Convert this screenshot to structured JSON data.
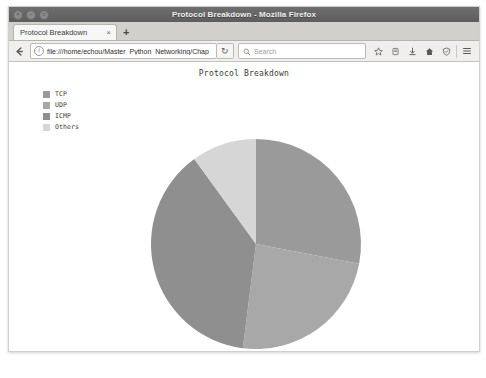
{
  "window": {
    "title": "Protocol Breakdown - Mozilla Firefox",
    "controls": [
      {
        "name": "close",
        "glyph": "×"
      },
      {
        "name": "minimize",
        "glyph": "−"
      },
      {
        "name": "maximize",
        "glyph": "□"
      }
    ]
  },
  "tabs": {
    "items": [
      {
        "label": "Protocol Breakdown",
        "close_glyph": "×"
      }
    ],
    "new_tab_glyph": "+"
  },
  "navbar": {
    "back_icon": "back-arrow-icon",
    "url_value": "file:///home/echou/Master_Python_Networking/Chap",
    "url_placeholder": "Search or enter address",
    "identity_glyph": "i",
    "reload_glyph": "↻",
    "search_placeholder": "Search",
    "tool_icons": [
      {
        "name": "bookmark-star-icon"
      },
      {
        "name": "reader-pocket-icon"
      },
      {
        "name": "downloads-icon"
      },
      {
        "name": "home-icon"
      },
      {
        "name": "shield-icon"
      },
      {
        "name": "menu-hamburger-icon"
      }
    ]
  },
  "colors": {
    "tcp": "#9a9a9a",
    "udp": "#a8a8a8",
    "icmp": "#8f8f8f",
    "others": "#d6d6d6",
    "page_bg": "#ffffff",
    "text": "#3a3a3a"
  },
  "chart_data": {
    "type": "pie",
    "title": "Protocol Breakdown",
    "xlabel": "",
    "ylabel": "",
    "legend_position": "upper-left",
    "grid": false,
    "start_angle": 90,
    "direction": "clockwise",
    "categories": [
      "TCP",
      "UDP",
      "ICMP",
      "Others"
    ],
    "values": [
      28,
      24,
      38,
      10
    ],
    "colors": [
      "#9a9a9a",
      "#a8a8a8",
      "#8f8f8f",
      "#d6d6d6"
    ],
    "slices": [
      {
        "label": "TCP",
        "value": 28,
        "percent": 28,
        "color": "#9a9a9a"
      },
      {
        "label": "UDP",
        "value": 24,
        "percent": 24,
        "color": "#a8a8a8"
      },
      {
        "label": "ICMP",
        "value": 38,
        "percent": 38,
        "color": "#8f8f8f"
      },
      {
        "label": "Others",
        "value": 10,
        "percent": 10,
        "color": "#d6d6d6"
      }
    ]
  }
}
